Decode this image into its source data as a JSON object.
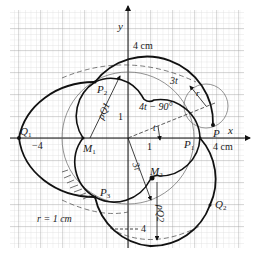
{
  "diagram": {
    "type": "geometric construction",
    "colors": {
      "background": "#ffffff",
      "grid_minor": "#c8c8c8",
      "grid_major": "#9a9a9a",
      "curve": "#111111",
      "thin_circle": "#555555"
    },
    "axes": {
      "x_label": "x",
      "y_label": "y"
    },
    "points": {
      "Q1": "Q",
      "Q1_sub": "1",
      "Q2": "Q",
      "Q2_sub": "2",
      "M1": "M",
      "M1_sub": "1",
      "M2": "M",
      "M2_sub": "2",
      "P": "P",
      "P1": "P",
      "P1_sub": "1",
      "P2": "P",
      "P2_sub": "2",
      "P3": "P",
      "P3_sub": "3"
    },
    "labels": {
      "top_dimension": "4 cm",
      "right_dimension": "4 cm",
      "left_tick": "−4",
      "bottom_dimension": "4",
      "x_tick_1": "1",
      "y_tick_1": "1",
      "angle_label": "4t − 90°",
      "angle_t": "t",
      "angle_3t": "3t",
      "radius_r": "r",
      "rho_q1": "ρQ1",
      "rho_q2": "ρQ2",
      "radius_3r": "3r",
      "radius_note": "r = 1 cm"
    }
  }
}
